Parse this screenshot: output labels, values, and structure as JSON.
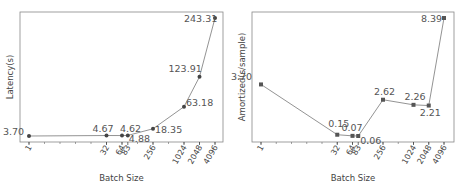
{
  "chart_data": [
    {
      "type": "line",
      "title": "",
      "xlabel": "Batch Size",
      "ylabel": "Latency(s)",
      "x_scale": "log2",
      "categories": [
        "1",
        "32",
        "64",
        "83",
        "256",
        "1024",
        "2048",
        "4096"
      ],
      "x": [
        1,
        32,
        64,
        83,
        256,
        1024,
        2048,
        4096
      ],
      "values": [
        3.7,
        4.67,
        4.62,
        4.88,
        18.35,
        63.18,
        123.91,
        243.31
      ],
      "data_labels": [
        "3.70",
        "4.67",
        "4.62",
        "4.88",
        "18.35",
        "63.18",
        "123.91",
        "243.31"
      ],
      "marker": "circle",
      "grid": false
    },
    {
      "type": "line",
      "title": "",
      "xlabel": "Batch Size",
      "ylabel": "Amortized(s/sample)",
      "x_scale": "log2",
      "categories": [
        "1",
        "32",
        "64",
        "83",
        "256",
        "1024",
        "2048",
        "4096"
      ],
      "x": [
        1,
        32,
        64,
        83,
        256,
        1024,
        2048,
        4096
      ],
      "values": [
        3.7,
        0.15,
        0.07,
        0.06,
        2.62,
        2.26,
        2.21,
        8.39
      ],
      "data_labels": [
        "3.70",
        "0.15",
        "0.07",
        "0.06",
        "2.62",
        "2.26",
        "2.21",
        "8.39"
      ],
      "marker": "square",
      "grid": false
    }
  ]
}
